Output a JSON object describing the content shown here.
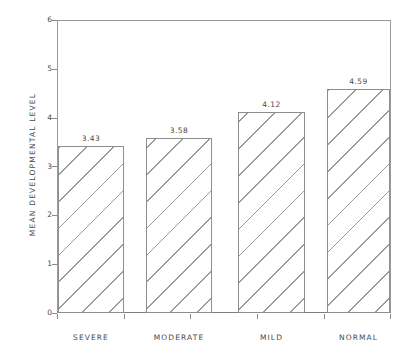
{
  "chart_data": {
    "type": "bar",
    "title": "",
    "subtitle": "",
    "xlabel": "",
    "ylabel": "MEAN DEVELOPMENTAL LEVEL",
    "categories": [
      "SEVERE",
      "MODERATE",
      "MILD",
      "NORMAL"
    ],
    "values": [
      3.43,
      3.58,
      4.12,
      4.59
    ],
    "value_labels": [
      "3.43",
      "3.58",
      "4.12",
      "4.59"
    ],
    "ylim": [
      0,
      6
    ],
    "ytick_labels": [
      "0",
      "1",
      "2",
      "3",
      "4",
      "5",
      "6"
    ],
    "ytick_values": [
      0,
      1,
      2,
      3,
      4,
      5,
      6
    ],
    "grid": false,
    "legend": null,
    "legend_position": "none",
    "bar_fill": "hatched-diagonal",
    "bar_edge_color": "#8e8e8e",
    "axis_color": "#9a9a9a",
    "text_color": "#4a4a4a",
    "background": "#ffffff"
  }
}
